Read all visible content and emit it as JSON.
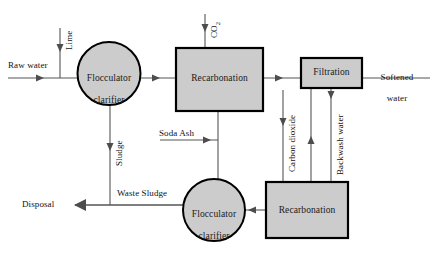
{
  "diagram": {
    "type": "process-flow-diagram",
    "colors": {
      "node_fill": "#cccccc",
      "node_stroke": "#000000",
      "line": "#555555",
      "text": "#111111",
      "background": "#ffffff"
    }
  },
  "nodes": [
    {
      "id": "flocculator-clarifier-1",
      "shape": "circle",
      "label": "Flocculator\nclarifier",
      "line1": "Flocculator",
      "line2": "clarifier"
    },
    {
      "id": "recarbonation-1",
      "shape": "rectangle",
      "label": "Recarbonation"
    },
    {
      "id": "filtration",
      "shape": "rectangle",
      "label": "Filtration"
    },
    {
      "id": "flocculator-clarifier-2",
      "shape": "circle",
      "label": "Flocculator\nclarifier",
      "line1": "Flocculator",
      "line2": "clarifier"
    },
    {
      "id": "recarbonation-2",
      "shape": "rectangle",
      "label": "Recarbonation"
    }
  ],
  "flow_labels": {
    "raw_water": "Raw water",
    "lime": "Lime",
    "co2": "CO",
    "co2_subscript": "2",
    "sludge": "Sludge",
    "soda_ash": "Soda Ash",
    "carbon_dioxide": "Carbon dioxide",
    "backwash_water": "Backwash water",
    "softened_water_line1": "Softened",
    "softened_water_line2": "water",
    "waste_sludge": "Waste Sludge",
    "disposal": "Disposal"
  }
}
